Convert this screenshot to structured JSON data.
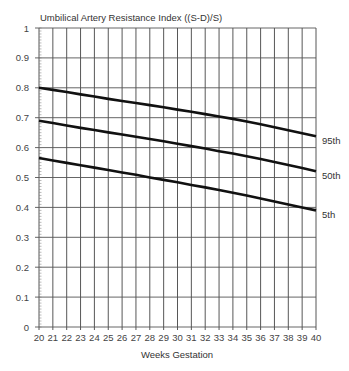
{
  "chart_data": {
    "type": "line",
    "title": "Umbilical Artery Resistance Index ((S-D)/S)",
    "xlabel": "Weeks Gestation",
    "ylabel": "",
    "x": [
      20,
      21,
      22,
      23,
      24,
      25,
      26,
      27,
      28,
      29,
      30,
      31,
      32,
      33,
      34,
      35,
      36,
      37,
      38,
      39,
      40
    ],
    "xlim": [
      20,
      40
    ],
    "ylim": [
      0,
      1
    ],
    "yticks": [
      "0",
      "0.1",
      "0.2",
      "0.3",
      "0.4",
      "0.5",
      "0.6",
      "0.7",
      "0.8",
      "0.9",
      "1"
    ],
    "xticks": [
      "20",
      "21",
      "22",
      "23",
      "24",
      "25",
      "26",
      "27",
      "28",
      "29",
      "30",
      "31",
      "32",
      "33",
      "34",
      "35",
      "36",
      "37",
      "38",
      "39",
      "40"
    ],
    "grid": true,
    "legend_position": "inline-right",
    "series": [
      {
        "name": "95th",
        "values": [
          0.8,
          0.793,
          0.786,
          0.778,
          0.771,
          0.763,
          0.756,
          0.749,
          0.742,
          0.735,
          0.727,
          0.72,
          0.712,
          0.704,
          0.696,
          0.687,
          0.678,
          0.668,
          0.658,
          0.648,
          0.638
        ]
      },
      {
        "name": "50th",
        "values": [
          0.69,
          0.682,
          0.674,
          0.666,
          0.659,
          0.651,
          0.644,
          0.636,
          0.629,
          0.621,
          0.613,
          0.605,
          0.597,
          0.588,
          0.58,
          0.571,
          0.562,
          0.552,
          0.542,
          0.532,
          0.521
        ]
      },
      {
        "name": "5th",
        "values": [
          0.565,
          0.557,
          0.549,
          0.541,
          0.533,
          0.525,
          0.517,
          0.509,
          0.5,
          0.492,
          0.484,
          0.475,
          0.467,
          0.458,
          0.449,
          0.44,
          0.43,
          0.42,
          0.41,
          0.4,
          0.39
        ]
      }
    ]
  }
}
